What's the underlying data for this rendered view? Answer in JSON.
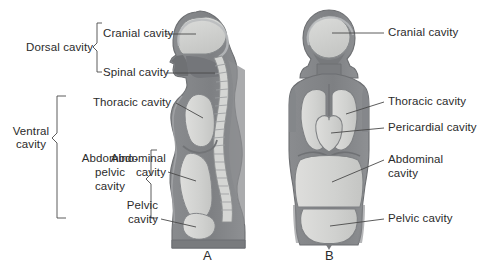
{
  "figure": {
    "panels": [
      {
        "letter": "A",
        "view": "lateral"
      },
      {
        "letter": "B",
        "view": "anterior"
      }
    ]
  },
  "brackets": [
    {
      "name": "dorsal-cavity",
      "label": "Dorsal cavity"
    },
    {
      "name": "ventral-cavity",
      "label": "Ventral\ncavity",
      "line1": "Ventral",
      "line2": "cavity"
    },
    {
      "name": "abdominopelvic-cavity",
      "label": "Abdomino-\npelvic\ncavity",
      "line1": "Abdomino-",
      "line2": "pelvic",
      "line3": "cavity"
    }
  ],
  "labels_left": [
    {
      "name": "cranial-cavity",
      "text": "Cranial cavity"
    },
    {
      "name": "spinal-cavity",
      "text": "Spinal cavity"
    },
    {
      "name": "thoracic-cavity",
      "text": "Thoracic cavity"
    },
    {
      "name": "abdominal-cavity",
      "line1": "Abdominal",
      "line2": "cavity"
    },
    {
      "name": "pelvic-cavity",
      "line1": "Pelvic",
      "line2": "cavity"
    }
  ],
  "labels_right": [
    {
      "name": "cranial-cavity",
      "text": "Cranial cavity"
    },
    {
      "name": "thoracic-cavity",
      "text": "Thoracic cavity"
    },
    {
      "name": "pericardial-cavity",
      "text": "Pericardial cavity"
    },
    {
      "name": "abdominal-cavity",
      "line1": "Abdominal",
      "line2": "cavity"
    },
    {
      "name": "pelvic-cavity",
      "text": "Pelvic cavity"
    }
  ],
  "panel_letters": {
    "a": "A",
    "b": "B"
  },
  "colors": {
    "body_dark": "#7f8184",
    "body_mid": "#9a9c9f",
    "cavity_light": "#d2d3d2",
    "cavity_lighter": "#dedfdd",
    "outline": "#6d6f72",
    "leader": "#4a4a4a",
    "text": "#2b2b2b",
    "background": "#ffffff"
  }
}
